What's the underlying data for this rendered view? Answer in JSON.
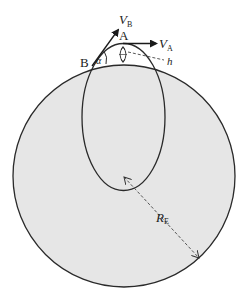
{
  "diagram": {
    "type": "orbital-geometry",
    "colors": {
      "background": "#ffffff",
      "earth_fill": "#e6e6e6",
      "stroke": "#2a2a2a",
      "dashed": "#444444"
    },
    "earth": {
      "label_main": "R",
      "label_sub": "E"
    },
    "orbit": {
      "shape": "ellipse"
    },
    "points": {
      "A": {
        "label": "A"
      },
      "B": {
        "label": "B"
      }
    },
    "vectors": {
      "VA": {
        "label_main": "V",
        "label_sub": "A"
      },
      "VB": {
        "label_main": "V",
        "label_sub": "B"
      }
    },
    "angle": {
      "label": "α"
    },
    "height": {
      "label": "h"
    }
  }
}
